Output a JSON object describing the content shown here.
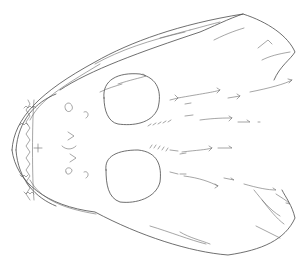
{
  "image": {
    "subject": "skull-line-drawing",
    "width": 307,
    "height": 268,
    "background": "#ffffff",
    "stroke_color": "#4a4a4a"
  },
  "shapes": {
    "outline_upper": "M 12 150 C 14 118, 40 92, 95 62 C 130 42, 180 24, 243 14 C 268 22, 288 36, 295 52 C 290 60, 280 66, 274 80",
    "outline_lower": "M 12 150 C 16 182, 46 206, 95 212 C 140 236, 190 252, 228 255 C 262 250, 285 240, 295 218 C 292 205, 286 198, 282 190",
    "upper_ridge": "M 60 90 C 90 70, 140 52, 200 32 C 210 28, 230 18, 243 14",
    "upper_ridge2": "M 95 64 C 120 50, 150 40, 185 32",
    "inner_upper": "M 30 120 C 40 100, 60 88, 100 64",
    "inner_lower": "M 30 180 C 40 198, 60 208, 96 214",
    "jaw_outer": "M 16 150 C 18 120, 36 102, 56 94",
    "jaw_outer_low": "M 16 150 C 18 180, 36 198, 56 206",
    "teeth_row": "M 24 108 l 2 -2 l 2 2 l 2 -2 l 2 2 l 2 -2 l 2 2 M 20 125 l 2 -2 l 2 2 l 2 -2 l 2 2 M 20 175 l 2 2 l 2 -2 l 2 2 l 2 -2 M 24 192 l 2 2 l 2 -2 l 2 2 l 2 -2 l 2 2",
    "teeth_zigzag": "M 28 100 L 30 104 L 26 110 L 30 116 L 26 122 L 30 128 L 26 134 L 30 140 L 26 146 L 30 152 L 26 158 L 30 164 L 26 170 L 30 176 L 26 182 L 30 188 L 26 194 L 30 200",
    "teeth_inner": "M 34 100 C 32 120, 32 180, 34 200",
    "snout_v": "M 34 148 L 42 148 M 38 144 L 38 152",
    "orbit_upper": "M 104 98 C 102 80, 118 72, 140 74 C 158 78, 162 92, 158 108 C 152 124, 132 126, 118 124 C 108 122, 104 110, 104 98 Z",
    "orbit_lower": "M 106 170 C 104 156, 118 150, 138 150 C 158 152, 162 166, 160 182 C 156 198, 136 204, 120 202 C 108 198, 106 184, 106 170 Z",
    "face_marks": "M 66 110 C 62 104, 70 100, 72 106 C 74 110, 68 114, 66 110 M 84 112 C 88 110, 90 116, 86 118 M 68 132 L 74 136 L 68 140 M 62 146 C 66 150, 72 150, 76 146 M 70 154 L 76 158 L 70 162 M 66 172 C 64 168, 70 166, 72 170 C 72 174, 66 176, 66 172 M 84 172 C 88 170, 90 176, 86 178",
    "orbit_teeth_upper": "M 148 126 l 3 -2 M 153 125 l 3 -2 M 158 124 l 3 -2 M 163 123 l 3 -2 M 168 122 l 3 -2",
    "orbit_teeth_lower": "M 150 148 l 2 -3 M 154 148 l 2 -3 M 158 149 l 2 -3 M 162 150 l 2 -3 M 166 151 l 2 -3",
    "arrows": [
      "M 170 100 l 8 -2 l -3 -3 M 178 98 l -3 3",
      "M 185 104 l 6 -1",
      "M 178 98 C 200 94, 215 92, 220 90 l -3 -2 M 220 90 l -3 3",
      "M 228 98 l 12 -2 l -3 -2 M 240 96 l -3 3",
      "M 250 92 C 270 88, 285 84, 292 80 l -4 -1 M 292 80 l -3 3",
      "M 185 116 l 8 -1",
      "M 200 120 C 215 118, 225 118, 232 118 l -3 -2 M 232 118 l -3 3",
      "M 238 122 l 12 0 l -3 -2",
      "M 258 122 l 2 0",
      "M 170 150 l 8 1",
      "M 180 154 l 6 -1",
      "M 182 152 C 198 150, 205 150, 212 148 l -3 -2 M 212 148 l -3 3",
      "M 218 148 l 14 0 l -3 -2",
      "M 170 172 l 8 2",
      "M 180 174 l 6 0",
      "M 184 176 C 200 178, 210 182, 218 186 l -3 -2 M 218 186 l -3 2",
      "M 224 178 l 10 2 l -3 -2",
      "M 244 184 C 258 188, 268 190, 276 190 l -3 -2",
      "M 276 194 C 282 198, 286 200, 290 204 l -4 -1",
      "M 214 40 C 230 32, 238 30, 244 28",
      "M 190 30 C 205 26, 212 24, 220 22",
      "M 160 38 C 175 34, 182 32, 190 30",
      "M 258 48 L 268 40 L 272 44",
      "M 262 60 C 270 56, 278 54, 290 52",
      "M 118 84 C 130 80, 140 78, 146 76 l -3 -2",
      "M 100 92 C 108 88, 116 86, 122 84"
    ],
    "lower_feathers": [
      "M 150 226 C 170 232, 190 240, 206 244",
      "M 180 232 C 190 238, 200 240, 210 244",
      "M 254 190 C 262 200, 270 210, 280 216",
      "M 262 200 C 270 210, 276 218, 284 224",
      "M 256 226 C 264 230, 272 234, 280 238"
    ]
  }
}
